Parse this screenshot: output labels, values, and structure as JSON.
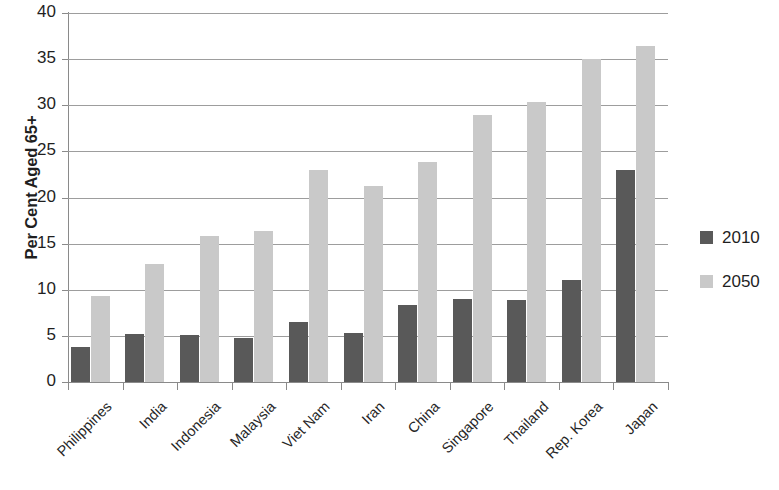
{
  "chart_data": {
    "type": "bar",
    "title": "",
    "subtitle": "",
    "xlabel": "",
    "ylabel": "Per Cent Aged 65+",
    "ylim": [
      0,
      40
    ],
    "ytick_step": 5,
    "yticks": [
      40,
      35,
      30,
      25,
      20,
      15,
      10,
      5,
      0
    ],
    "ytick_labels": [
      "40",
      "35",
      "30",
      "25",
      "20",
      "15",
      "10",
      "5",
      "0"
    ],
    "grid": true,
    "grid_axis": "y",
    "legend_position": "right",
    "categories": [
      "Philippines",
      "India",
      "Indonesia",
      "Malaysia",
      "Viet Nam",
      "Iran",
      "China",
      "Singapore",
      "Thailand",
      "Rep. Korea",
      "Japan"
    ],
    "series": [
      {
        "name": "2010",
        "color": "#595959",
        "values": [
          3.8,
          5.2,
          5.1,
          4.8,
          6.5,
          5.3,
          8.4,
          9.0,
          8.9,
          11.1,
          23.0
        ]
      },
      {
        "name": "2050",
        "color": "#c9c9c9",
        "values": [
          9.3,
          12.8,
          15.8,
          16.4,
          23.0,
          21.3,
          23.8,
          28.9,
          30.3,
          35.0,
          36.4
        ]
      }
    ]
  },
  "legend": {
    "items": [
      {
        "label": "2010",
        "color": "#595959"
      },
      {
        "label": "2050",
        "color": "#c9c9c9"
      }
    ]
  },
  "axis": {
    "y_title": "Per Cent Aged 65+"
  },
  "colors": {
    "series_2010": "#595959",
    "series_2050": "#c9c9c9",
    "gridline": "#9d9d9d",
    "axis": "#8a8a8a",
    "text": "#262626",
    "background": "#ffffff"
  }
}
